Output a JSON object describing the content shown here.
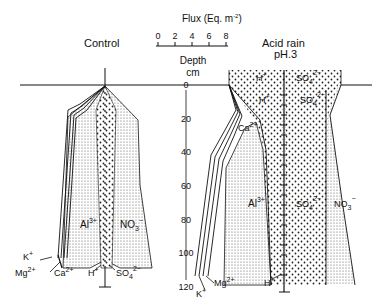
{
  "flux_scale": {
    "title": "Flux (Eq. m",
    "title_exp": "-2",
    "title_close": ")",
    "ticks": [
      "0",
      "2",
      "4",
      "6",
      "8"
    ]
  },
  "depth_axis": {
    "label_line1": "Depth",
    "label_line2": "cm",
    "ticks": [
      "0",
      "20",
      "40",
      "60",
      "80",
      "100",
      "120"
    ]
  },
  "control": {
    "title": "Control",
    "labels": {
      "al": "Al",
      "al_sup": "3+",
      "no3": "NO",
      "no3_sub": "3",
      "no3_sup": "−",
      "k": "K",
      "k_sup": "+",
      "mg": "Mg",
      "mg_sup": "2+",
      "ca": "Ca",
      "ca_sup": "2+",
      "h": "H",
      "h_sup": "+",
      "so4": "SO",
      "so4_sub": "4",
      "so4_sup": "2−"
    }
  },
  "acid_rain": {
    "title_line1": "Acid rain",
    "title_line2": "pH.3",
    "labels": {
      "h_top": "H",
      "h_top_sup": "+",
      "so4_top": "SO",
      "so4_top_sub": "4",
      "so4_top_sup": "2−",
      "h_mid": "H",
      "h_mid_sup": "+",
      "so4_mid": "SO",
      "so4_mid_sub": "4",
      "so4_mid_sup": "2−",
      "ca": "Ca",
      "ca_sup": "2+",
      "al": "Al",
      "al_sup": "3+",
      "so4_low": "SO",
      "so4_low_sub": "4",
      "so4_low_sup": "2−",
      "no3": "NO",
      "no3_sub": "3",
      "no3_sup": "−",
      "k": "K",
      "k_sup": "+",
      "mg": "Mg",
      "mg_sup": "2+",
      "h": "H",
      "h_sup": "+"
    }
  }
}
